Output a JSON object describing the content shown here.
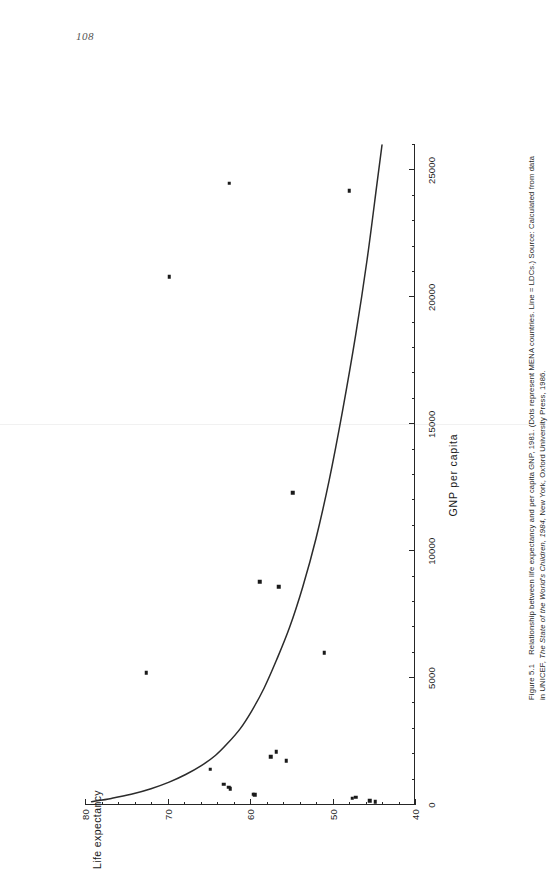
{
  "page": {
    "number": "108"
  },
  "figure": {
    "caption_line1_figno": "Figure 5.1",
    "caption_line1_text": "Relationship between life expectancy and per capita GNP, 1981. (Dots represent MENA countries. Line = LDCs.) Source: Calculated from data",
    "caption_line2_a": "in UNICEF, ",
    "caption_line2_italic1": "The State of the World's Children, 1984,",
    "caption_line2_b": " New York, Oxford University Press, 1986.",
    "source_label": "Source:",
    "line_legend": "Line = LDCs.",
    "dots_legend": "Dots represent MENA countries."
  },
  "chart_data": {
    "type": "scatter",
    "title": "Relationship between life expectancy and per capita GNP, 1981",
    "xlabel": "GNP per capita",
    "ylabel": "Life expectancy",
    "xlim": [
      0,
      26000
    ],
    "ylim": [
      40,
      80
    ],
    "grid": false,
    "legend_position": "none",
    "x_ticks_major": [
      0,
      5000,
      10000,
      15000,
      20000,
      25000
    ],
    "x_ticklabels": [
      "0",
      "5000",
      "10000",
      "15000",
      "20000",
      "25000"
    ],
    "x_tick_minor_step": 1000,
    "y_ticks_major": [
      40,
      50,
      60,
      70,
      80
    ],
    "y_ticklabels": [
      "40",
      "50",
      "60",
      "70",
      "80"
    ],
    "y_tick_minor_step": 2,
    "series": [
      {
        "name": "Dots represent MENA countries.",
        "marker": "square",
        "color": "#1a1a1a",
        "points": [
          {
            "x": 24500,
            "y": 62.5
          },
          {
            "x": 24200,
            "y": 48.0
          },
          {
            "x": 20800,
            "y": 69.8
          },
          {
            "x": 12300,
            "y": 54.8
          },
          {
            "x": 8800,
            "y": 58.8
          },
          {
            "x": 8600,
            "y": 56.5
          },
          {
            "x": 6000,
            "y": 51.0
          },
          {
            "x": 5200,
            "y": 72.6
          },
          {
            "x": 2100,
            "y": 56.8
          },
          {
            "x": 1900,
            "y": 57.5
          },
          {
            "x": 1750,
            "y": 55.6
          },
          {
            "x": 1400,
            "y": 64.8
          },
          {
            "x": 820,
            "y": 63.2
          },
          {
            "x": 700,
            "y": 62.6
          },
          {
            "x": 640,
            "y": 62.4
          },
          {
            "x": 420,
            "y": 59.6
          },
          {
            "x": 400,
            "y": 59.4
          },
          {
            "x": 310,
            "y": 47.2
          },
          {
            "x": 260,
            "y": 47.6
          },
          {
            "x": 170,
            "y": 45.5
          },
          {
            "x": 130,
            "y": 44.8
          }
        ]
      },
      {
        "name": "Line = LDCs.",
        "type": "curve",
        "color": "#2b2b2b",
        "description": "Fitted curve of GNP per capita against life expectancy for LDCs",
        "points": [
          {
            "x": 130,
            "y": 79.2
          },
          {
            "x": 260,
            "y": 76.8
          },
          {
            "x": 420,
            "y": 74.4
          },
          {
            "x": 640,
            "y": 72.0
          },
          {
            "x": 900,
            "y": 69.8
          },
          {
            "x": 1200,
            "y": 67.8
          },
          {
            "x": 1550,
            "y": 65.9
          },
          {
            "x": 1950,
            "y": 64.2
          },
          {
            "x": 2400,
            "y": 62.8
          },
          {
            "x": 3000,
            "y": 61.2
          },
          {
            "x": 3700,
            "y": 59.8
          },
          {
            "x": 4600,
            "y": 58.3
          },
          {
            "x": 5700,
            "y": 56.8
          },
          {
            "x": 7000,
            "y": 55.2
          },
          {
            "x": 8600,
            "y": 53.6
          },
          {
            "x": 10500,
            "y": 52.0
          },
          {
            "x": 12800,
            "y": 50.4
          },
          {
            "x": 15500,
            "y": 48.8
          },
          {
            "x": 18500,
            "y": 47.2
          },
          {
            "x": 21500,
            "y": 45.8
          },
          {
            "x": 24500,
            "y": 44.6
          },
          {
            "x": 26000,
            "y": 44.0
          }
        ]
      }
    ]
  }
}
